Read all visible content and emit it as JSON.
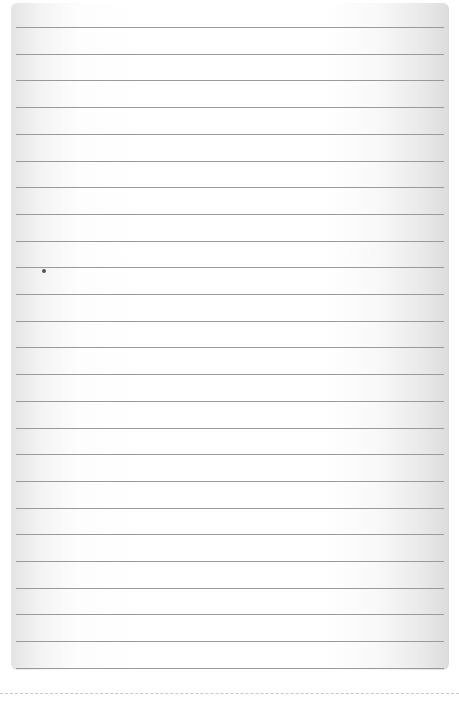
{
  "page": {
    "type": "lined-paper",
    "line_count": 25,
    "first_line_y": 27,
    "line_spacing": 26.7,
    "line_color": "#9a9a9a",
    "paper_edge_shade": "#dcdcdc",
    "marks": [
      {
        "name": "ink-dot",
        "x": 44,
        "y": 271
      }
    ]
  }
}
